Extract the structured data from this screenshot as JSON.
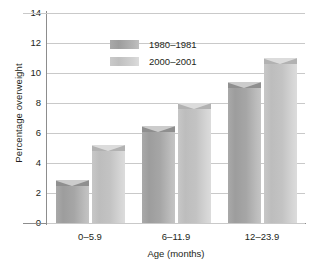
{
  "chart_data": {
    "type": "bar",
    "title": "",
    "subtitle": "",
    "xlabel": "Age (months)",
    "ylabel": "Percentage overweight",
    "categories": [
      "0–5.9",
      "6–11.9",
      "12–23.9"
    ],
    "series": [
      {
        "name": "1980–1981",
        "values": [
          2.9,
          6.5,
          9.4
        ],
        "color": "#a3a3a3"
      },
      {
        "name": "2000–2001",
        "values": [
          5.2,
          8.0,
          11.0
        ],
        "color": "#c7c7c7"
      }
    ],
    "ylim": [
      0,
      14
    ],
    "yticks": [
      0,
      2,
      4,
      6,
      8,
      10,
      12,
      14
    ],
    "ytick_labels": [
      "0",
      "2",
      "4",
      "6",
      "8",
      "10",
      "12",
      "14"
    ],
    "grid": "horizontal",
    "legend_position": "inside-top-left",
    "bar_style": "3d-beveled",
    "background": "#ffffff",
    "axis_color": "#8d8d8d",
    "gridline_color": "#c9c9c9",
    "text_color": "#231f20"
  }
}
